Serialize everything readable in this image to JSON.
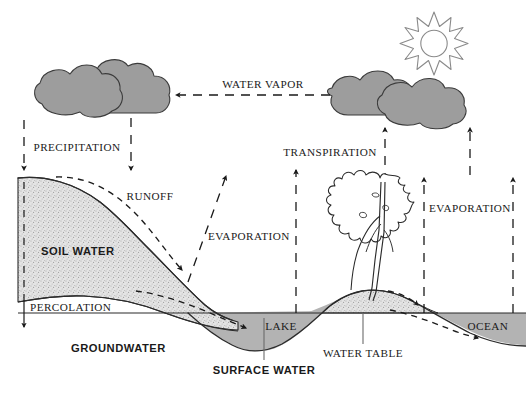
{
  "diagram": {
    "background_color": "#ffffff",
    "ink_color": "#1a1a1a",
    "cloud_fill": "#9d9d9d",
    "water_fill": "#b3b3b3",
    "soil_fill": "#d9d9d9",
    "labels": {
      "water_vapor": "WATER VAPOR",
      "precipitation": "PRECIPITATION",
      "transpiration": "TRANSPIRATION",
      "evaporation_left": "EVAPORATION",
      "evaporation_right": "EVAPORATION",
      "runoff": "RUNOFF",
      "soil_water": "SOIL WATER",
      "percolation": "PERCOLATION",
      "groundwater": "GROUNDWATER",
      "surface_water": "SURFACE WATER",
      "water_table": "WATER TABLE",
      "lake": "LAKE",
      "ocean": "OCEAN"
    },
    "elements": {
      "sun": "sun-icon",
      "cloud_left": "cloud-icon",
      "cloud_right": "cloud-icon",
      "tree": "tree-icon"
    }
  }
}
